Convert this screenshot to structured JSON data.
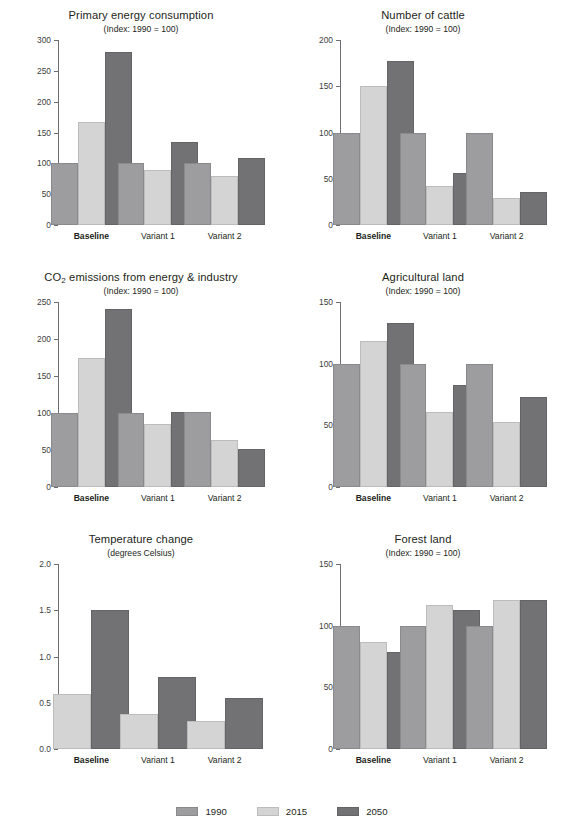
{
  "legend": {
    "items": [
      {
        "label": "1990",
        "key": "s1990",
        "color": "#9d9d9f"
      },
      {
        "label": "2015",
        "key": "s2015",
        "color": "#d4d4d4"
      },
      {
        "label": "2050",
        "key": "s2050",
        "color": "#727274"
      }
    ]
  },
  "categories": [
    "Baseline",
    "Variant 1",
    "Variant 2"
  ],
  "chart_data": [
    {
      "id": "primary-energy-consumption",
      "type": "bar",
      "title": "Primary energy consumption",
      "subtitle": "(Index: 1990 = 100)",
      "xlabel": "",
      "ylabel": "",
      "ylim": [
        0,
        300
      ],
      "yticks": [
        0,
        50,
        100,
        150,
        200,
        250,
        300
      ],
      "ytick_labels": [
        "0",
        "50",
        "100",
        "150",
        "200",
        "250",
        "300"
      ],
      "grid": false,
      "legend_position": "bottom-shared",
      "categories": [
        "Baseline",
        "Variant 1",
        "Variant 2"
      ],
      "series": [
        {
          "name": "1990",
          "values": [
            100,
            100,
            101
          ]
        },
        {
          "name": "2015",
          "values": [
            167,
            90,
            80
          ]
        },
        {
          "name": "2050",
          "values": [
            280,
            134,
            108
          ]
        }
      ]
    },
    {
      "id": "number-of-cattle",
      "type": "bar",
      "title": "Number of cattle",
      "subtitle": "(Index: 1990 = 100)",
      "xlabel": "",
      "ylabel": "",
      "ylim": [
        0,
        200
      ],
      "yticks": [
        0,
        50,
        100,
        150,
        200
      ],
      "ytick_labels": [
        "0",
        "50",
        "100",
        "150",
        "200"
      ],
      "grid": false,
      "legend_position": "bottom-shared",
      "categories": [
        "Baseline",
        "Variant 1",
        "Variant 2"
      ],
      "series": [
        {
          "name": "1990",
          "values": [
            100,
            100,
            100
          ]
        },
        {
          "name": "2015",
          "values": [
            150,
            42,
            29
          ]
        },
        {
          "name": "2050",
          "values": [
            177,
            56,
            36
          ]
        }
      ]
    },
    {
      "id": "co2-emissions-from-energy-and-industry",
      "type": "bar",
      "title": "CO2 emissions from energy & industry",
      "title_html": "CO<sub>2</sub> emissions from energy &amp; industry",
      "subtitle": "(Index: 1990 = 100)",
      "xlabel": "",
      "ylabel": "",
      "ylim": [
        0,
        250
      ],
      "yticks": [
        0,
        50,
        100,
        150,
        200,
        250
      ],
      "ytick_labels": [
        "0",
        "50",
        "100",
        "150",
        "200",
        "250"
      ],
      "grid": false,
      "legend_position": "bottom-shared",
      "categories": [
        "Baseline",
        "Variant 1",
        "Variant 2"
      ],
      "series": [
        {
          "name": "1990",
          "values": [
            100,
            100,
            101
          ]
        },
        {
          "name": "2015",
          "values": [
            175,
            85,
            64
          ]
        },
        {
          "name": "2050",
          "values": [
            240,
            102,
            52
          ]
        }
      ]
    },
    {
      "id": "agricultural-land",
      "type": "bar",
      "title": "Agricultural land",
      "subtitle": "(Index: 1990 = 100)",
      "xlabel": "",
      "ylabel": "",
      "ylim": [
        0,
        150
      ],
      "yticks": [
        0,
        50,
        100,
        150
      ],
      "ytick_labels": [
        "0",
        "50",
        "100",
        "150"
      ],
      "grid": false,
      "legend_position": "bottom-shared",
      "categories": [
        "Baseline",
        "Variant 1",
        "Variant 2"
      ],
      "series": [
        {
          "name": "1990",
          "values": [
            100,
            100,
            100
          ]
        },
        {
          "name": "2015",
          "values": [
            118,
            61,
            53
          ]
        },
        {
          "name": "2050",
          "values": [
            133,
            83,
            73
          ]
        }
      ]
    },
    {
      "id": "temperature-change",
      "type": "bar",
      "title": "Temperature change",
      "subtitle": "(degrees Celsius)",
      "xlabel": "",
      "ylabel": "",
      "ylim": [
        0,
        2.0
      ],
      "yticks": [
        0,
        0.5,
        1.0,
        1.5,
        2.0
      ],
      "ytick_labels": [
        "0.0",
        "0.5",
        "1.0",
        "1.5",
        "2.0"
      ],
      "grid": false,
      "legend_position": "bottom-shared",
      "categories": [
        "Baseline",
        "Variant 1",
        "Variant 2"
      ],
      "series": [
        {
          "name": "2015",
          "values": [
            0.59,
            0.38,
            0.3
          ]
        },
        {
          "name": "2050",
          "values": [
            1.5,
            0.78,
            0.55
          ]
        }
      ]
    },
    {
      "id": "forest-land",
      "type": "bar",
      "title": "Forest land",
      "subtitle": "(Index: 1990 = 100)",
      "xlabel": "",
      "ylabel": "",
      "ylim": [
        0,
        150
      ],
      "yticks": [
        0,
        50,
        100,
        150
      ],
      "ytick_labels": [
        "0",
        "50",
        "100",
        "150"
      ],
      "grid": false,
      "legend_position": "bottom-shared",
      "categories": [
        "Baseline",
        "Variant 1",
        "Variant 2"
      ],
      "series": [
        {
          "name": "1990",
          "values": [
            100,
            100,
            100
          ]
        },
        {
          "name": "2015",
          "values": [
            87,
            117,
            121
          ]
        },
        {
          "name": "2050",
          "values": [
            79,
            113,
            121
          ]
        }
      ]
    }
  ]
}
